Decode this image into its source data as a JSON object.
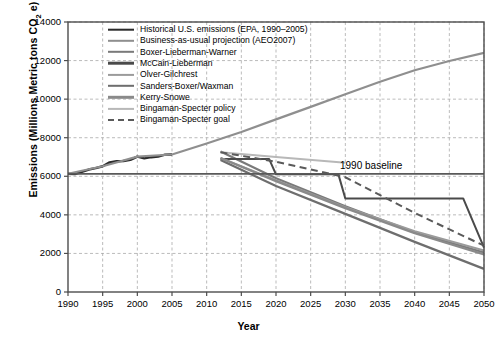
{
  "chart_data": {
    "type": "line",
    "title": "",
    "xlabel": "Year",
    "ylabel": "Emissions (Millions Metric tons CO2 e)",
    "xlim": [
      1990,
      2050
    ],
    "ylim": [
      0,
      14000
    ],
    "xticks": [
      1990,
      1995,
      2000,
      2005,
      2010,
      2015,
      2020,
      2025,
      2030,
      2035,
      2040,
      2045,
      2050
    ],
    "yticks": [
      0,
      2000,
      4000,
      6000,
      8000,
      10000,
      12000,
      14000
    ],
    "grid": true,
    "grid_style": "dashed",
    "legend_position": "upper-left-inside",
    "annotations": [
      {
        "text": "1990 baseline",
        "x": 2035,
        "y": 6500
      }
    ],
    "series": [
      {
        "name": "Historical U.S. emissions (EPA, 1990–2005)",
        "color": "#2b2b2b",
        "width": 2.4,
        "dash": "none",
        "points": [
          [
            1990,
            6130
          ],
          [
            1991,
            6110
          ],
          [
            1992,
            6230
          ],
          [
            1993,
            6350
          ],
          [
            1994,
            6420
          ],
          [
            1995,
            6520
          ],
          [
            1996,
            6720
          ],
          [
            1997,
            6780
          ],
          [
            1998,
            6790
          ],
          [
            1999,
            6850
          ],
          [
            2000,
            7020
          ],
          [
            2001,
            6930
          ],
          [
            2002,
            6990
          ],
          [
            2003,
            7020
          ],
          [
            2004,
            7120
          ],
          [
            2005,
            7130
          ]
        ]
      },
      {
        "name": "Business-as-usual projection (AEO2007)",
        "color": "#8f8f8f",
        "width": 2.2,
        "dash": "none",
        "points": [
          [
            1990,
            6130
          ],
          [
            1995,
            6520
          ],
          [
            2000,
            7020
          ],
          [
            2005,
            7130
          ],
          [
            2010,
            7700
          ],
          [
            2015,
            8300
          ],
          [
            2020,
            8950
          ],
          [
            2025,
            9600
          ],
          [
            2030,
            10250
          ],
          [
            2035,
            10900
          ],
          [
            2040,
            11500
          ],
          [
            2045,
            11980
          ],
          [
            2050,
            12400
          ]
        ]
      },
      {
        "name": "Boxer-Lieberman-Warner",
        "color": "#7a7a7a",
        "width": 2.2,
        "dash": "none",
        "points": [
          [
            2012,
            7280
          ],
          [
            2020,
            5900
          ],
          [
            2030,
            4450
          ],
          [
            2040,
            3100
          ],
          [
            2050,
            2050
          ]
        ]
      },
      {
        "name": "McCain-Lieberman",
        "color": "#4a4a4a",
        "width": 2.0,
        "dash": "none",
        "points": [
          [
            2012,
            6900
          ],
          [
            2019,
            6900
          ],
          [
            2020,
            6100
          ],
          [
            2029,
            6100
          ],
          [
            2030,
            4850
          ],
          [
            2047,
            4850
          ],
          [
            2050,
            2300
          ]
        ]
      },
      {
        "name": "Olver-Gilchrest",
        "color": "#9b9b9b",
        "width": 2.0,
        "dash": "none",
        "points": [
          [
            2012,
            6950
          ],
          [
            2020,
            5800
          ],
          [
            2030,
            4400
          ],
          [
            2040,
            3150
          ],
          [
            2050,
            2150
          ]
        ]
      },
      {
        "name": "Sanders-Boxer/Waxman",
        "color": "#6e6e6e",
        "width": 2.2,
        "dash": "none",
        "points": [
          [
            2012,
            6850
          ],
          [
            2020,
            5500
          ],
          [
            2030,
            4050
          ],
          [
            2040,
            2600
          ],
          [
            2050,
            1200
          ]
        ]
      },
      {
        "name": "Kerry-Snowe",
        "color": "#8a8a8a",
        "width": 2.2,
        "dash": "none",
        "points": [
          [
            2012,
            6950
          ],
          [
            2020,
            5750
          ],
          [
            2030,
            4350
          ],
          [
            2040,
            3050
          ],
          [
            2050,
            1950
          ]
        ]
      },
      {
        "name": "Bingaman-Specter policy",
        "color": "#b8b8b8",
        "width": 2.0,
        "dash": "none",
        "points": [
          [
            2012,
            7250
          ],
          [
            2020,
            7000
          ],
          [
            2030,
            6700
          ]
        ]
      },
      {
        "name": "Bingaman-Specter goal",
        "color": "#5a5a5a",
        "width": 2.0,
        "dash": "dashed",
        "points": [
          [
            2012,
            7250
          ],
          [
            2020,
            6750
          ],
          [
            2030,
            5950
          ],
          [
            2040,
            4100
          ],
          [
            2050,
            2400
          ]
        ]
      },
      {
        "name": "1990 baseline",
        "color": "#595959",
        "width": 1.8,
        "dash": "none",
        "points": [
          [
            1990,
            6130
          ],
          [
            2050,
            6130
          ]
        ]
      }
    ]
  },
  "legend": {
    "items": [
      {
        "label": "Historical U.S. emissions (EPA, 1990–2005)",
        "color": "#2b2b2b",
        "width": 2.6,
        "dash": "none"
      },
      {
        "label": "Business-as-usual projection (AEO2007)",
        "color": "#8f8f8f",
        "width": 2.4,
        "dash": "none"
      },
      {
        "label": "Boxer-Lieberman-Warner",
        "color": "#7a7a7a",
        "width": 2.4,
        "dash": "none"
      },
      {
        "label": "McCain-Lieberman",
        "color": "#4a4a4a",
        "width": 2.6,
        "dash": "none"
      },
      {
        "label": "Olver-Gilchrest",
        "color": "#9b9b9b",
        "width": 2.2,
        "dash": "none"
      },
      {
        "label": "Sanders-Boxer/Waxman",
        "color": "#6e6e6e",
        "width": 2.4,
        "dash": "none"
      },
      {
        "label": "Kerry-Snowe",
        "color": "#8a8a8a",
        "width": 2.4,
        "dash": "none"
      },
      {
        "label": "Bingaman-Specter policy",
        "color": "#b8b8b8",
        "width": 2.2,
        "dash": "none"
      },
      {
        "label": "Bingaman-Specter goal",
        "color": "#5a5a5a",
        "width": 2.2,
        "dash": "dashed"
      }
    ]
  },
  "axis": {
    "y_title_main": "Emissions (Millions Metric tons CO",
    "y_title_sub": "2",
    "y_title_tail": " e)",
    "x_title": "Year"
  },
  "colors": {
    "frame": "#4d4d4d",
    "grid": "#a9a9a9",
    "text": "#000000",
    "background": "#ffffff"
  }
}
